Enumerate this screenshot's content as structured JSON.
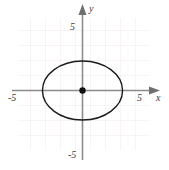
{
  "figure": {
    "title": "",
    "background_color": "#ffffff"
  },
  "chart_data": {
    "type": "line",
    "title": "",
    "subtitle": "",
    "xlabel": "x",
    "ylabel": "y",
    "xlim": [
      -6.2,
      6.2
    ],
    "ylim": [
      -5.8,
      5.8
    ],
    "grid": true,
    "grid_spacing": 1,
    "legend": "none",
    "axis_arrows": true,
    "x_tick_labels": [
      "-5",
      "5"
    ],
    "x_tick_values": [
      -5,
      5
    ],
    "y_tick_labels": [
      "5",
      "-5"
    ],
    "y_tick_values": [
      5,
      -5
    ],
    "curve": {
      "name": "ellipse",
      "equation": "x^2/9 + y^2/4 = 1",
      "center": [
        0,
        0
      ],
      "semi_axis_x": 3,
      "semi_axis_y": 2,
      "stroke_color": "#1a1a1a",
      "stroke_width": 1.4,
      "filled": false
    },
    "points": [
      {
        "name": "center",
        "x": 0,
        "y": 0,
        "marker": "filled-circle",
        "color": "#111111",
        "radius": 3.2
      }
    ],
    "colors": {
      "grid": "#f0e6e8",
      "axis": "#8c8c8c",
      "curve": "#1a1a1a",
      "point": "#111111",
      "label": "#3b3b3b"
    }
  },
  "labels": {
    "y_axis_name": "y",
    "x_axis_name": "x",
    "y_tick_positive": "5",
    "y_tick_negative": "-5",
    "x_tick_negative": "-5",
    "x_tick_positive": "5"
  }
}
